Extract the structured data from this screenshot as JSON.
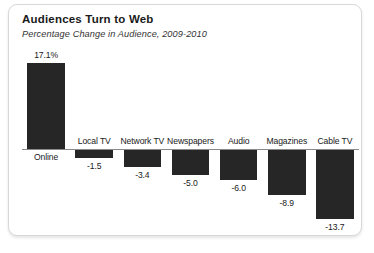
{
  "card": {
    "background": "#ffffff",
    "border_color": "#d8d8d8"
  },
  "chart_data": {
    "type": "bar",
    "title": "Audiences Turn to Web",
    "subtitle": "Percentage Change in Audience, 2009-2010",
    "xlabel": "",
    "ylabel": "",
    "grid": false,
    "legend": false,
    "bar_color": "#262626",
    "axis_color": "#8a8a8a",
    "zero_line": 0,
    "ylim": [
      -15,
      18
    ],
    "categories": [
      "Online",
      "Local TV",
      "Network TV",
      "Newspapers",
      "Audio",
      "Magazines",
      "Cable TV"
    ],
    "values": [
      17.1,
      -1.5,
      -3.4,
      -5.0,
      -6.0,
      -8.9,
      -13.7
    ],
    "value_labels": [
      "17.1%",
      "-1.5",
      "-3.4",
      "-5.0",
      "-6.0",
      "-8.9",
      "-13.7"
    ]
  }
}
